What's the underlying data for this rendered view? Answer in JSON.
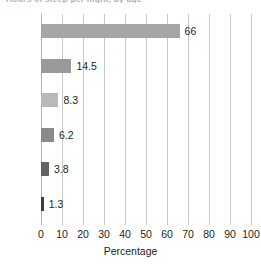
{
  "title_fragment": "Hours of sleep per night, by age",
  "chart_data": {
    "type": "bar",
    "orientation": "horizontal",
    "title": "",
    "xlabel": "Percentage",
    "ylabel": "",
    "xlim": [
      0,
      100
    ],
    "xticks": [
      0,
      10,
      20,
      30,
      40,
      50,
      60,
      70,
      80,
      90,
      100
    ],
    "grid": true,
    "legend": false,
    "categories": [
      "≤8",
      "9–10",
      "11–12",
      "13–15",
      "16–20",
      "≥21"
    ],
    "values": [
      66,
      14.5,
      8.3,
      6.2,
      3.8,
      1.3
    ],
    "value_labels": [
      "66",
      "14.5",
      "8.3",
      "6.2",
      "3.8",
      "1.3"
    ],
    "bar_colors": [
      "#a6a6a6",
      "#9a9a9a",
      "#b9b9b9",
      "#8a8a8a",
      "#636363",
      "#3d3d3d"
    ]
  }
}
